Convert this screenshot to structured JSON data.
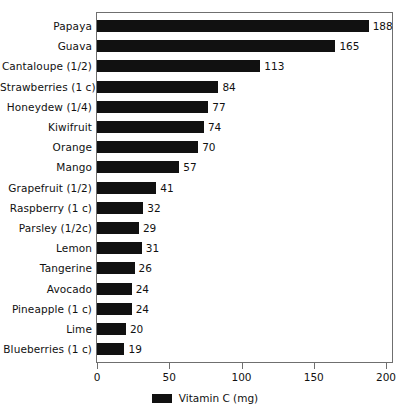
{
  "chart_data": {
    "type": "bar",
    "orientation": "horizontal",
    "title": "",
    "xlabel": "",
    "ylabel": "",
    "xlim": [
      0,
      200
    ],
    "xticks": [
      0,
      50,
      100,
      150,
      200
    ],
    "xtick_labels": [
      "0",
      "50",
      "100",
      "150",
      "200"
    ],
    "grid": false,
    "legend_position": "bottom-center",
    "series": [
      {
        "name": "Vitamin C (mg)",
        "color": "#111111",
        "values": [
          188,
          165,
          113,
          84,
          77,
          74,
          70,
          57,
          41,
          32,
          29,
          31,
          26,
          24,
          24,
          20,
          19
        ]
      }
    ],
    "categories": [
      "Papaya",
      "Guava",
      "Cantaloupe (1/2)",
      "Strawberries (1 c)",
      "Honeydew (1/4)",
      "Kiwifruit",
      "Orange",
      "Mango",
      "Grapefruit (1/2)",
      "Raspberry (1 c)",
      "Parsley (1/2c)",
      "Lemon",
      "Tangerine",
      "Avocado",
      "Pineapple (1 c)",
      "Lime",
      "Blueberries (1 c)"
    ],
    "data_labels": [
      "188",
      "165",
      "113",
      "84",
      "77",
      "74",
      "70",
      "57",
      "41",
      "32",
      "29",
      "31",
      "26",
      "24",
      "24",
      "20",
      "19"
    ]
  },
  "legend": {
    "label": "Vitamin C (mg)",
    "swatch_color": "#111111"
  },
  "colors": {
    "bar": "#111111",
    "axis": "#6f6f6f",
    "text": "#111111",
    "background": "#ffffff"
  }
}
